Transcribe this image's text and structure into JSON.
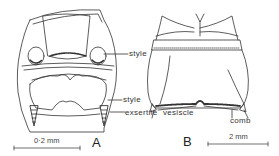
{
  "figure": {
    "panels": [
      {
        "id": "A",
        "label": "A",
        "scale_bar": "0·2 mm",
        "annotations": [
          "style",
          "style",
          "exsertile"
        ]
      },
      {
        "id": "B",
        "label": "B",
        "scale_bar": "2 mm",
        "annotations": [
          "vesiscle",
          "comb"
        ]
      }
    ],
    "labels": {
      "style_upper": "style",
      "style_lower": "style",
      "exsertile": "exsertile",
      "vesiscle": "vesiscle",
      "comb": "comb"
    }
  }
}
